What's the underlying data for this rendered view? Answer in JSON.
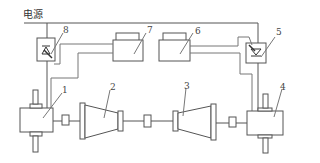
{
  "diagram": {
    "power_label": "电源",
    "colors": {
      "line": "#555555",
      "thin_line": "#777777",
      "background": "#ffffff"
    },
    "components": [
      {
        "id": "1",
        "label": "1",
        "name": "left-gearbox"
      },
      {
        "id": "2",
        "label": "2",
        "name": "left-cone-drum"
      },
      {
        "id": "3",
        "label": "3",
        "name": "right-cone-drum"
      },
      {
        "id": "4",
        "label": "4",
        "name": "right-gearbox"
      },
      {
        "id": "5",
        "label": "5",
        "name": "right-sensor"
      },
      {
        "id": "6",
        "label": "6",
        "name": "right-control-unit"
      },
      {
        "id": "7",
        "label": "7",
        "name": "left-control-unit"
      },
      {
        "id": "8",
        "label": "8",
        "name": "left-sensor"
      }
    ]
  }
}
